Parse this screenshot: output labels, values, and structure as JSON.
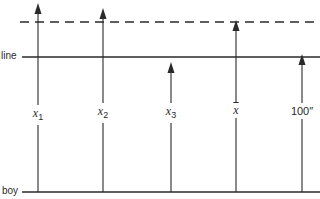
{
  "diagram": {
    "lines": {
      "line_label": "line",
      "boy_label": "boy",
      "line_y": 57,
      "boy_y": 192,
      "dashed_y": 22
    },
    "arrows": [
      {
        "id": "x1",
        "base": "x",
        "sub": "1",
        "overline": false,
        "x": 38,
        "top": 3
      },
      {
        "id": "x2",
        "base": "x",
        "sub": "2",
        "overline": false,
        "x": 103,
        "top": 8
      },
      {
        "id": "x3",
        "base": "x",
        "sub": "3",
        "overline": false,
        "x": 171,
        "top": 62
      },
      {
        "id": "xbar",
        "base": "x",
        "sub": "",
        "overline": true,
        "x": 236,
        "top": 20
      },
      {
        "id": "100in",
        "base": "100″",
        "sub": "",
        "overline": false,
        "x": 302,
        "top": 54
      }
    ],
    "colors": {
      "stroke": "#2a2a2a",
      "background": "#ffffff"
    }
  }
}
